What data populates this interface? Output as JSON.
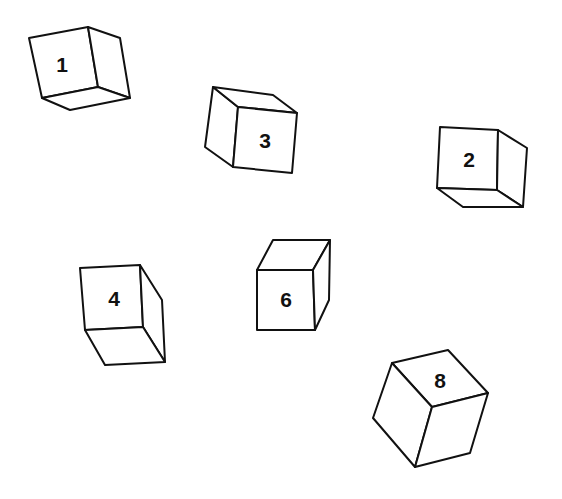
{
  "diagram": {
    "type": "rotated-cubes",
    "background": "#ffffff",
    "stroke_color": "#111111",
    "cubes": [
      {
        "label": "1",
        "visible_faces": [
          "front",
          "right",
          "bottom"
        ]
      },
      {
        "label": "3",
        "visible_faces": [
          "left",
          "top",
          "front"
        ]
      },
      {
        "label": "2",
        "visible_faces": [
          "front",
          "right",
          "bottom"
        ]
      },
      {
        "label": "4",
        "visible_faces": [
          "front",
          "right",
          "bottom"
        ]
      },
      {
        "label": "6",
        "visible_faces": [
          "top",
          "front",
          "right"
        ]
      },
      {
        "label": "8",
        "visible_faces": [
          "top",
          "left",
          "right"
        ]
      }
    ]
  }
}
